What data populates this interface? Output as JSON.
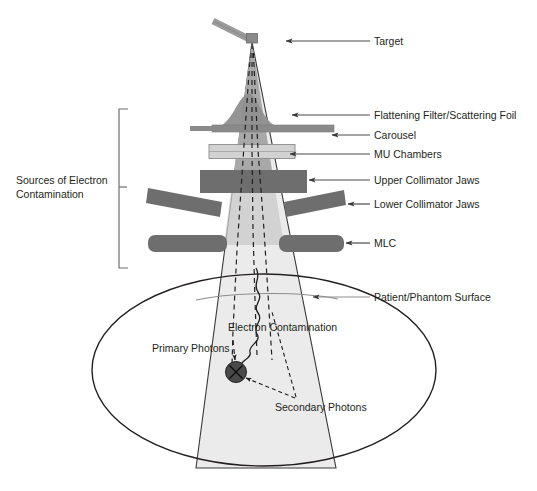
{
  "figure": {
    "kind": "linac-treatment-head-schematic",
    "background_color": "#ffffff",
    "width": 537,
    "height": 491
  },
  "colors": {
    "beam_cone_light": "#ebebeb",
    "beam_cone_upper": "#a8a8a8",
    "component_dark_gray": "#6e6e6e",
    "carousel_gray": "#8c8c8c",
    "mu_chamber_light": "#d2d2d2",
    "waveguide_gray": "#9a9a9a",
    "outline_black": "#231f20",
    "surface_line": "#6f6f6f",
    "dose_point": "#4a4a4a",
    "leader_line": "#4a4a4a",
    "bracket": "#6e6e6e"
  },
  "right_labels": [
    {
      "id": "target",
      "text": "Target",
      "text_x": 374,
      "text_y": 45,
      "arrow_from_x": 370,
      "arrow_from_y": 41,
      "arrow_to_x": 286,
      "arrow_to_y": 41
    },
    {
      "id": "flattening-filter",
      "text": "Flattening Filter/Scattering Foil",
      "text_x": 374,
      "text_y": 119,
      "arrow_from_x": 370,
      "arrow_from_y": 115,
      "arrow_to_x": 292,
      "arrow_to_y": 115
    },
    {
      "id": "carousel",
      "text": "Carousel",
      "text_x": 374,
      "text_y": 139,
      "arrow_from_x": 370,
      "arrow_from_y": 135,
      "arrow_to_x": 330,
      "arrow_to_y": 135
    },
    {
      "id": "mu-chambers",
      "text": "MU Chambers",
      "text_x": 374,
      "text_y": 158,
      "arrow_from_x": 370,
      "arrow_from_y": 154,
      "arrow_to_x": 286,
      "arrow_to_y": 154
    },
    {
      "id": "upper-collimator-jaws",
      "text": "Upper Collimator Jaws",
      "text_x": 374,
      "text_y": 184,
      "arrow_from_x": 370,
      "arrow_from_y": 180,
      "arrow_to_x": 307,
      "arrow_to_y": 180
    },
    {
      "id": "lower-collimator-jaws",
      "text": "Lower Collimator Jaws",
      "text_x": 374,
      "text_y": 208,
      "arrow_from_x": 370,
      "arrow_from_y": 204,
      "arrow_to_x": 337,
      "arrow_to_y": 204
    },
    {
      "id": "mlc",
      "text": "MLC",
      "text_x": 374,
      "text_y": 247,
      "arrow_from_x": 370,
      "arrow_from_y": 243,
      "arrow_to_x": 343,
      "arrow_to_y": 243
    },
    {
      "id": "patient-phantom-surface",
      "text": "Patient/Phantom Surface",
      "text_x": 374,
      "text_y": 301,
      "arrow_from_x": 370,
      "arrow_from_y": 297,
      "arrow_to_x": 311,
      "arrow_to_y": 297
    }
  ],
  "bracket_label": {
    "id": "sources-of-electron-contamination",
    "line1": "Sources of Electron",
    "line2": "Contamination",
    "text_x": 16,
    "text_y1": 180,
    "text_y2": 194,
    "bracket_x": 119,
    "bracket_top": 109,
    "bracket_bottom": 268,
    "bracket_tick_y": 187,
    "bracket_tick_x": 126
  },
  "inner_labels": [
    {
      "id": "primary-photons",
      "text": "Primary Photons",
      "x": 152,
      "y": 348,
      "anchor": "start"
    },
    {
      "id": "electron-contamination",
      "text": "Electron Contamination",
      "x": 228,
      "y": 327,
      "anchor": "start"
    },
    {
      "id": "secondary-photons",
      "text": "Secondary Photons",
      "x": 275,
      "y": 407,
      "anchor": "start"
    }
  ],
  "components": {
    "waveguide": {
      "name": "electron-waveguide",
      "x1": 213,
      "y1": 21,
      "x2": 252,
      "y2": 41,
      "thickness": 6
    },
    "target_block": {
      "name": "target-block",
      "x": 247,
      "y": 34,
      "w": 11,
      "h": 9
    },
    "flattening_filter": {
      "name": "flattening-filter"
    },
    "carousel_bar": {
      "name": "carousel-bar",
      "x": 212,
      "y": 125,
      "w": 122,
      "h": 7
    },
    "mu_chambers_bar": {
      "name": "mu-chambers-bar",
      "x": 210,
      "y": 145,
      "w": 84,
      "h": 14
    },
    "upper_jaws_bar": {
      "name": "upper-collimator-jaws-bar",
      "x": 200,
      "y": 170,
      "w": 108,
      "h": 22
    },
    "lower_jaw_left": {
      "name": "lower-collimator-jaw-left"
    },
    "lower_jaw_right": {
      "name": "lower-collimator-jaw-right"
    },
    "mlc_left": {
      "name": "mlc-bank-left",
      "x": 148,
      "y": 235,
      "w": 78,
      "h": 17
    },
    "mlc_right": {
      "name": "mlc-bank-right",
      "x": 280,
      "y": 235,
      "w": 64,
      "h": 17
    },
    "patient_ellipse": {
      "name": "patient-phantom-ellipse",
      "cx": 264,
      "cy": 370,
      "rx": 172,
      "ry": 96
    },
    "dose_point": {
      "name": "dose-point-marker",
      "cx": 236,
      "cy": 372,
      "r": 10
    }
  }
}
